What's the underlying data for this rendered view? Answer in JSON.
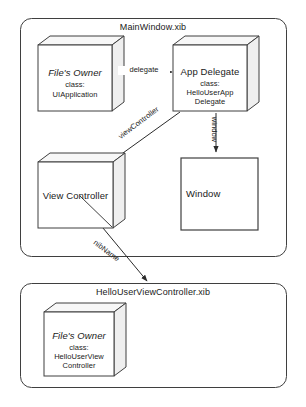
{
  "diagram": {
    "type": "uml-object-diagram",
    "colors": {
      "background": "#ffffff",
      "stroke": "#3a3a3a",
      "box_fill": "#ffffff",
      "box_top_fill": "#f7f7f7",
      "box_side_fill": "#efefef",
      "shadow": "#b9b9b9",
      "text": "#1a1a1a"
    },
    "containers": [
      {
        "id": "mainwindow",
        "title": "MainWindow.xib"
      },
      {
        "id": "hellouserviewcontroller",
        "title": "HelloUserViewController.xib"
      }
    ],
    "nodes": [
      {
        "id": "files-owner-main",
        "title": "File's Owner",
        "title_style": "italic",
        "sub_label": "class:",
        "class_lines": [
          "UIApplication"
        ],
        "shape": "cube"
      },
      {
        "id": "app-delegate",
        "title": "App Delegate",
        "title_style": "plain",
        "sub_label": "class:",
        "class_lines": [
          "HelloUserApp",
          "Delegate"
        ],
        "shape": "cube"
      },
      {
        "id": "view-controller",
        "title": "View Controller",
        "title_style": "plain",
        "sub_label": "",
        "class_lines": [],
        "shape": "cube"
      },
      {
        "id": "window",
        "title": "Window",
        "title_style": "plain",
        "sub_label": "",
        "class_lines": [],
        "shape": "rect"
      },
      {
        "id": "files-owner-vc",
        "title": "File's Owner",
        "title_style": "italic",
        "sub_label": "class:",
        "class_lines": [
          "HelloUserView",
          "Controller"
        ],
        "shape": "cube"
      }
    ],
    "edges": [
      {
        "id": "edge-delegate",
        "label": "delegate",
        "from": "files-owner-main",
        "to": "app-delegate",
        "orientation": "horizontal"
      },
      {
        "id": "edge-viewcontroller",
        "label": "viewController",
        "from": "app-delegate",
        "to": "view-controller",
        "orientation": "diagonal-up-right"
      },
      {
        "id": "edge-window",
        "label": "window",
        "from": "app-delegate",
        "to": "window",
        "orientation": "vertical"
      },
      {
        "id": "edge-nibname",
        "label": "nibName",
        "from": "view-controller",
        "to": "hellouserviewcontroller",
        "orientation": "diagonal-down-right"
      }
    ]
  }
}
